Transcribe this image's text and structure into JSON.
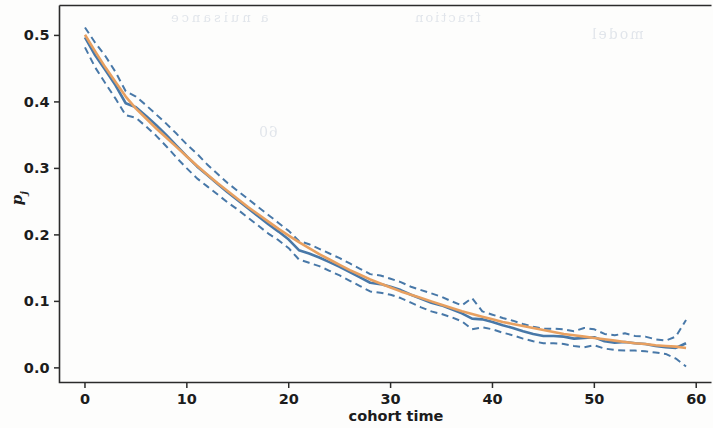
{
  "figure": {
    "background_color": "#fdfdfc",
    "axes_color": "#2b2b2b"
  },
  "ghost_text": {
    "note": "faint mirrored bleed-through from reverse of scanned page",
    "line1": "a nuisance",
    "line2": "fraction",
    "line3": "model",
    "line4": "60"
  },
  "chart_data": {
    "type": "line",
    "title": "",
    "subtitle": "",
    "xlabel": "cohort time",
    "ylabel": "p_j",
    "ylabel_display": "p",
    "ylabel_subscript": "j",
    "xlim": [
      -2.5,
      61.5
    ],
    "ylim": [
      -0.022,
      0.545
    ],
    "xticks": [
      0,
      10,
      20,
      30,
      40,
      50,
      60
    ],
    "xticklabels": [
      "0",
      "10",
      "20",
      "30",
      "40",
      "50",
      "60"
    ],
    "yticks": [
      0.0,
      0.1,
      0.2,
      0.3,
      0.4,
      0.5
    ],
    "yticklabels": [
      "0.0",
      "0.1",
      "0.2",
      "0.3",
      "0.4",
      "0.5"
    ],
    "grid": false,
    "legend": false,
    "legend_position": "none",
    "colors": {
      "empirical": "#4878a8",
      "fitted": "#e8a060",
      "confidence_band": "#4878a8"
    },
    "x": [
      0,
      1,
      2,
      3,
      4,
      5,
      6,
      7,
      8,
      9,
      10,
      11,
      12,
      13,
      14,
      15,
      16,
      17,
      18,
      19,
      20,
      21,
      22,
      23,
      24,
      25,
      26,
      27,
      28,
      29,
      30,
      31,
      32,
      33,
      34,
      35,
      36,
      37,
      38,
      39,
      40,
      41,
      42,
      43,
      44,
      45,
      46,
      47,
      48,
      49,
      50,
      51,
      52,
      53,
      54,
      55,
      56,
      57,
      58,
      59
    ],
    "series": [
      {
        "name": "empirical estimate",
        "style": "solid",
        "color": "#4878a8",
        "values": [
          0.497,
          0.47,
          0.448,
          0.425,
          0.398,
          0.392,
          0.379,
          0.365,
          0.35,
          0.334,
          0.318,
          0.303,
          0.29,
          0.277,
          0.264,
          0.252,
          0.24,
          0.228,
          0.216,
          0.205,
          0.193,
          0.177,
          0.172,
          0.166,
          0.159,
          0.152,
          0.144,
          0.136,
          0.128,
          0.126,
          0.122,
          0.117,
          0.11,
          0.104,
          0.098,
          0.094,
          0.088,
          0.082,
          0.074,
          0.073,
          0.069,
          0.064,
          0.06,
          0.055,
          0.051,
          0.048,
          0.048,
          0.047,
          0.044,
          0.045,
          0.046,
          0.04,
          0.038,
          0.039,
          0.037,
          0.036,
          0.033,
          0.031,
          0.03,
          0.037
        ]
      },
      {
        "name": "fitted model",
        "style": "solid",
        "color": "#e8a060",
        "values": [
          0.501,
          0.476,
          0.452,
          0.43,
          0.408,
          0.39,
          0.375,
          0.36,
          0.346,
          0.332,
          0.318,
          0.304,
          0.291,
          0.278,
          0.266,
          0.254,
          0.242,
          0.231,
          0.22,
          0.209,
          0.199,
          0.189,
          0.18,
          0.171,
          0.163,
          0.155,
          0.147,
          0.14,
          0.133,
          0.127,
          0.121,
          0.115,
          0.11,
          0.105,
          0.1,
          0.095,
          0.09,
          0.085,
          0.081,
          0.077,
          0.073,
          0.069,
          0.066,
          0.063,
          0.06,
          0.057,
          0.054,
          0.051,
          0.049,
          0.047,
          0.045,
          0.043,
          0.041,
          0.039,
          0.037,
          0.036,
          0.034,
          0.033,
          0.032,
          0.03
        ]
      },
      {
        "name": "upper confidence bound",
        "style": "dashed",
        "color": "#4878a8",
        "values": [
          0.512,
          0.489,
          0.469,
          0.445,
          0.416,
          0.408,
          0.395,
          0.381,
          0.367,
          0.352,
          0.336,
          0.322,
          0.306,
          0.292,
          0.278,
          0.266,
          0.254,
          0.242,
          0.23,
          0.218,
          0.206,
          0.191,
          0.186,
          0.179,
          0.172,
          0.165,
          0.157,
          0.149,
          0.141,
          0.139,
          0.134,
          0.129,
          0.122,
          0.117,
          0.112,
          0.107,
          0.1,
          0.094,
          0.105,
          0.085,
          0.08,
          0.075,
          0.071,
          0.066,
          0.062,
          0.059,
          0.059,
          0.058,
          0.055,
          0.06,
          0.058,
          0.051,
          0.049,
          0.052,
          0.048,
          0.047,
          0.043,
          0.041,
          0.047,
          0.072
        ]
      },
      {
        "name": "lower confidence bound",
        "style": "dashed",
        "color": "#4878a8",
        "values": [
          0.482,
          0.452,
          0.428,
          0.405,
          0.38,
          0.376,
          0.363,
          0.349,
          0.333,
          0.316,
          0.3,
          0.285,
          0.273,
          0.261,
          0.249,
          0.238,
          0.226,
          0.214,
          0.202,
          0.192,
          0.18,
          0.163,
          0.158,
          0.153,
          0.146,
          0.139,
          0.131,
          0.123,
          0.115,
          0.113,
          0.11,
          0.105,
          0.098,
          0.091,
          0.085,
          0.081,
          0.076,
          0.07,
          0.058,
          0.061,
          0.058,
          0.053,
          0.049,
          0.044,
          0.04,
          0.037,
          0.037,
          0.036,
          0.033,
          0.031,
          0.034,
          0.029,
          0.027,
          0.026,
          0.026,
          0.025,
          0.023,
          0.021,
          0.014,
          0.002
        ]
      }
    ]
  }
}
